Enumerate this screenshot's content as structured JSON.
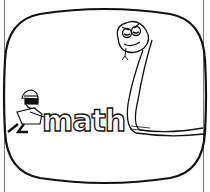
{
  "illustration": {
    "word": "math",
    "colors": {
      "ink": "#111111",
      "paper": "#ffffff"
    }
  }
}
